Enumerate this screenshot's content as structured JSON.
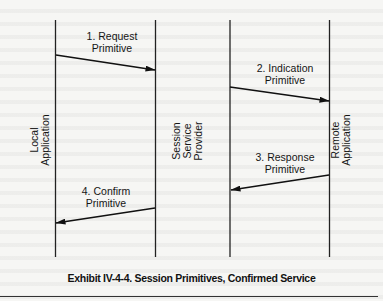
{
  "diagram": {
    "lifelines": [
      {
        "id": "local",
        "label_lines": [
          "Local",
          "Application"
        ]
      },
      {
        "id": "provider-left",
        "label_lines": [
          "Session",
          "Service",
          "Provider"
        ]
      },
      {
        "id": "provider-right",
        "label_lines": []
      },
      {
        "id": "remote",
        "label_lines": [
          "Remote",
          "Application"
        ]
      }
    ],
    "messages": [
      {
        "step": "1",
        "line1": "1. Request",
        "line2": "Primitive",
        "from": "local",
        "to": "provider-left"
      },
      {
        "step": "2",
        "line1": "2. Indication",
        "line2": "Primitive",
        "from": "provider-right",
        "to": "remote"
      },
      {
        "step": "3",
        "line1": "3. Response",
        "line2": "Primitive",
        "from": "remote",
        "to": "provider-right"
      },
      {
        "step": "4",
        "line1": "4. Confirm",
        "line2": "Primitive",
        "from": "provider-left",
        "to": "local"
      }
    ],
    "caption": "Exhibit IV-4-4. Session Primitives, Confirmed Service"
  }
}
